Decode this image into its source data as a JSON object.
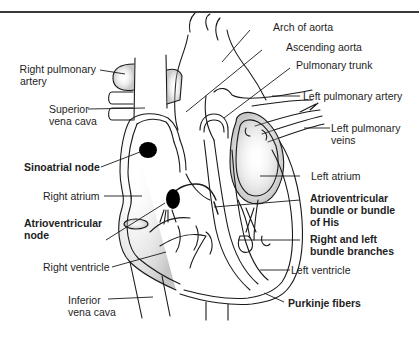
{
  "figure": {
    "labels": {
      "arch_of_aorta": "Arch of aorta",
      "ascending_aorta": "Ascending aorta",
      "pulmonary_trunk": "Pulmonary trunk",
      "left_pulmonary_artery": "Left pulmonary artery",
      "left_pulmonary_veins_1": "Left pulmonary",
      "left_pulmonary_veins_2": "veins",
      "left_atrium": "Left atrium",
      "av_bundle_1": "Atrioventricular",
      "av_bundle_2": "bundle or bundle",
      "av_bundle_3": "of His",
      "bundle_branches_1": "Right and left",
      "bundle_branches_2": "bundle branches",
      "left_ventricle": "Left ventricle",
      "purkinje_fibers": "Purkinje fibers",
      "right_pulmonary_artery_1": "Right pulmonary",
      "right_pulmonary_artery_2": "artery",
      "superior_vena_cava_1": "Superior",
      "superior_vena_cava_2": "vena cava",
      "sinoatrial_node": "Sinoatrial node",
      "right_atrium": "Right atrium",
      "av_node_1": "Atrioventricular",
      "av_node_2": "node",
      "right_ventricle": "Right ventricle",
      "inferior_vena_cava_1": "Inferior",
      "inferior_vena_cava_2": "vena cava"
    },
    "colors": {
      "line": "#1a1a1a",
      "node_fill": "#000000",
      "stipple": "#b8b8b8",
      "rule": "#3a3a3a"
    }
  }
}
